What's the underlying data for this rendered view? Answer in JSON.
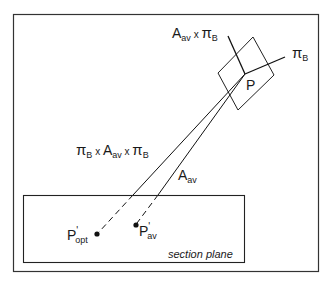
{
  "diagram": {
    "labels": {
      "axis_perp": {
        "main": "A",
        "sub": "av",
        "mid": " x ",
        "pi": "π",
        "pi_sub": "B"
      },
      "axis_pi": {
        "pi": "π",
        "sub": "B"
      },
      "point_p": "P",
      "line_opt": {
        "pi1": "π",
        "sub1": "B",
        "x1": " x ",
        "a": "A",
        "asub": "av",
        "x2": " x ",
        "pi2": "π",
        "sub2": "B"
      },
      "line_av": {
        "a": "A",
        "sub": "av"
      },
      "p_opt": {
        "main": "P",
        "prime": "'",
        "sub": "opt"
      },
      "p_av": {
        "main": "P",
        "prime": "'",
        "sub": "av"
      },
      "section_plane": "section plane"
    },
    "colors": {
      "stroke": "#1a1a1a",
      "background": "#ffffff"
    }
  }
}
